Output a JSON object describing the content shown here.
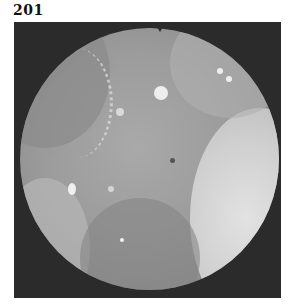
{
  "figure": {
    "label": "201",
    "kind": "endoscopic photograph",
    "colors": {
      "frame": "#2b2b2b",
      "mucosa": "#9c9c9c",
      "highlight": "#e8e8e8",
      "bright_fold": "#d6d6d6"
    }
  }
}
